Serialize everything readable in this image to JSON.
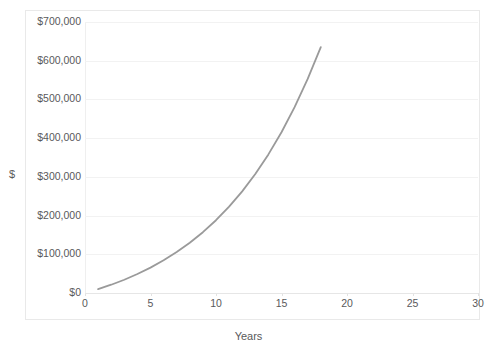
{
  "chart_data": {
    "type": "line",
    "title": "",
    "xlabel": "Years",
    "ylabel": "$",
    "xlim": [
      0,
      30
    ],
    "ylim": [
      0,
      700000
    ],
    "grid": true,
    "legend": false,
    "legend_position": "none",
    "series_color": "#9a9a9a",
    "gridline_color": "#f2f2f2",
    "tick_label_color": "#59595b",
    "x_tick_labels": [
      "0",
      "5",
      "10",
      "15",
      "20",
      "25",
      "30"
    ],
    "x_ticks": [
      0,
      5,
      10,
      15,
      20,
      25,
      30
    ],
    "y_tick_labels": [
      "$0",
      "$100,000",
      "$200,000",
      "$300,000",
      "$400,000",
      "$500,000",
      "$600,000",
      "$700,000"
    ],
    "y_ticks": [
      0,
      100000,
      200000,
      300000,
      400000,
      500000,
      600000,
      700000
    ],
    "series": [
      {
        "name": "Compound growth",
        "x": [
          1,
          2,
          3,
          4,
          5,
          6,
          7,
          8,
          9,
          10,
          11,
          12,
          13,
          14,
          15,
          16,
          17,
          18,
          19,
          20,
          21,
          22,
          23,
          24,
          25
        ],
        "values": [
          10000,
          21400,
          34300,
          49000,
          65600,
          84400,
          105700,
          129800,
          157100,
          188000,
          223000,
          262600,
          307400,
          358000,
          415200,
          480000,
          553000,
          635000,
          728000,
          833000,
          950000,
          1082000,
          1232000,
          1402000,
          1594000
        ]
      }
    ],
    "annotations": []
  },
  "chart": {
    "x_axis_title": "Years",
    "y_axis_title": "$",
    "y_labels": [
      "$700,000",
      "$600,000",
      "$500,000",
      "$400,000",
      "$300,000",
      "$200,000",
      "$100,000",
      "$0"
    ],
    "x_labels": [
      "0",
      "5",
      "10",
      "15",
      "20",
      "25",
      "30"
    ]
  }
}
